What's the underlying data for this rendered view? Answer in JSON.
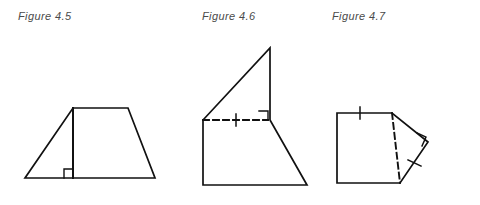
{
  "page": {
    "background_color": "#ffffff",
    "stroke_color": "#111111",
    "caption_color": "#4a4a4a"
  },
  "figures": [
    {
      "id": "figure-4-5",
      "caption": "Figure 4.5",
      "shape": "trapezoid",
      "description": "Isosceles trapezoid with an internal vertical altitude drawn from the left end of the top side to the base, marked with a right angle square at the base.",
      "vertices": {
        "bottom_left": [
          25,
          178
        ],
        "bottom_right": [
          155,
          178
        ],
        "top_right": [
          128,
          108
        ],
        "top_left": [
          73,
          108
        ]
      },
      "altitude": {
        "from": [
          73,
          108
        ],
        "to": [
          73,
          178
        ],
        "style": "solid"
      },
      "right_angle_marks": [
        {
          "at": [
            73,
            178
          ],
          "opens": "left-up",
          "size": 9
        }
      ],
      "tick_marks": []
    },
    {
      "id": "figure-4-6",
      "caption": "Figure 4.6",
      "shape": "pentagon",
      "description": "Pentagon with a tall apex at top; an internal dashed horizontal segment joins the left side to the interior vertex, carrying one tick mark and a right angle square at its right end.",
      "vertices": {
        "bottom_left": [
          203,
          185
        ],
        "bottom_right": [
          307,
          185
        ],
        "mid_right": [
          270,
          120
        ],
        "apex_top": [
          270,
          48
        ],
        "mid_left": [
          203,
          120
        ]
      },
      "dashed_segment": {
        "from": [
          203,
          120
        ],
        "to": [
          268,
          120
        ],
        "style": "dashed"
      },
      "right_angle_marks": [
        {
          "at": [
            268,
            120
          ],
          "opens": "left-up",
          "size": 9
        }
      ],
      "tick_marks": [
        {
          "on": "dashed_segment",
          "at": [
            236,
            120
          ],
          "orientation": "vertical",
          "count": 1
        }
      ]
    },
    {
      "id": "figure-4-7",
      "caption": "Figure 4.7",
      "shape": "quadrilateral",
      "description": "Irregular quadrilateral with a dashed diagonal from the top vertex to the bottom right vertex; one tick on the top edge, one tick on the lower right edge, and a right angle square at the right vertex.",
      "vertices": {
        "top_left": [
          337,
          113
        ],
        "top_mid": [
          392,
          113
        ],
        "right": [
          428,
          142
        ],
        "bottom_right": [
          400,
          183
        ],
        "bottom_left": [
          337,
          183
        ]
      },
      "dashed_segment": {
        "from": [
          392,
          113
        ],
        "to": [
          400,
          183
        ],
        "style": "dashed"
      },
      "right_angle_marks": [
        {
          "at": [
            428,
            142
          ],
          "opens": "down-left",
          "size": 9
        }
      ],
      "tick_marks": [
        {
          "on": "top_edge",
          "at": [
            360,
            113
          ],
          "orientation": "vertical",
          "count": 1
        },
        {
          "on": "lower_right_edge",
          "at": [
            414,
            163
          ],
          "orientation": "perpendicular",
          "count": 1
        }
      ]
    }
  ]
}
